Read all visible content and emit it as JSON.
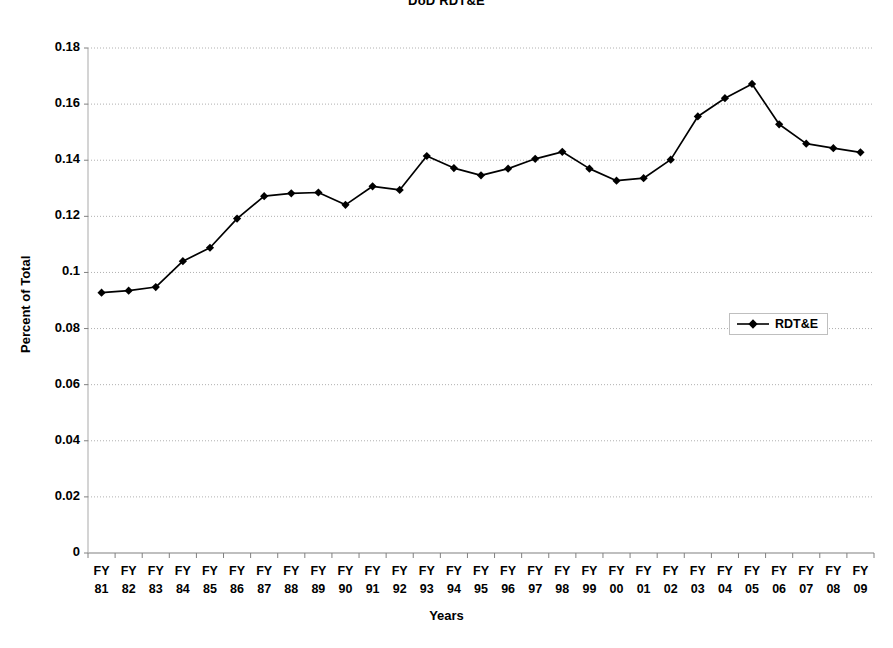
{
  "chart_data": {
    "type": "line",
    "title": "DoD RDT&E",
    "xlabel": "Years",
    "ylabel": "Percent of Total",
    "grid": true,
    "legend_position": "middle-right",
    "ylim": [
      0,
      0.18
    ],
    "ytick_labels": [
      "0.18",
      "0.16",
      "0.14",
      "0.12",
      "0.1",
      "0.08",
      "0.06",
      "0.04",
      "0.02",
      "0"
    ],
    "ytick_values": [
      0.18,
      0.16,
      0.14,
      0.12,
      0.1,
      0.08,
      0.06,
      0.04,
      0.02,
      0
    ],
    "categories": [
      "FY 81",
      "FY 82",
      "FY 83",
      "FY 84",
      "FY 85",
      "FY 86",
      "FY 87",
      "FY 88",
      "FY 89",
      "FY 90",
      "FY 91",
      "FY 92",
      "FY 93",
      "FY 94",
      "FY 95",
      "FY 96",
      "FY 97",
      "FY 98",
      "FY 99",
      "FY 00",
      "FY 01",
      "FY 02",
      "FY 03",
      "FY 04",
      "FY 05",
      "FY 06",
      "FY 07",
      "FY 08",
      "FY 09"
    ],
    "category_lines": [
      [
        "FY",
        "81"
      ],
      [
        "FY",
        "82"
      ],
      [
        "FY",
        "83"
      ],
      [
        "FY",
        "84"
      ],
      [
        "FY",
        "85"
      ],
      [
        "FY",
        "86"
      ],
      [
        "FY",
        "87"
      ],
      [
        "FY",
        "88"
      ],
      [
        "FY",
        "89"
      ],
      [
        "FY",
        "90"
      ],
      [
        "FY",
        "91"
      ],
      [
        "FY",
        "92"
      ],
      [
        "FY",
        "93"
      ],
      [
        "FY",
        "94"
      ],
      [
        "FY",
        "95"
      ],
      [
        "FY",
        "96"
      ],
      [
        "FY",
        "97"
      ],
      [
        "FY",
        "98"
      ],
      [
        "FY",
        "99"
      ],
      [
        "FY",
        "00"
      ],
      [
        "FY",
        "01"
      ],
      [
        "FY",
        "02"
      ],
      [
        "FY",
        "03"
      ],
      [
        "FY",
        "04"
      ],
      [
        "FY",
        "05"
      ],
      [
        "FY",
        "06"
      ],
      [
        "FY",
        "07"
      ],
      [
        "FY",
        "08"
      ],
      [
        "FY",
        "09"
      ]
    ],
    "series": [
      {
        "name": "RDT&E",
        "marker": "diamond",
        "color": "#000000",
        "values": [
          0.0928,
          0.0935,
          0.0948,
          0.104,
          0.1088,
          0.1192,
          0.1272,
          0.1282,
          0.1285,
          0.1241,
          0.1307,
          0.1294,
          0.1415,
          0.1372,
          0.1346,
          0.137,
          0.1405,
          0.143,
          0.137,
          0.1327,
          0.1336,
          0.1402,
          0.1556,
          0.1621,
          0.1672,
          0.1528,
          0.1459,
          0.1443,
          0.1428
        ]
      }
    ]
  },
  "legend": {
    "entries": [
      {
        "label": "RDT&E"
      }
    ]
  }
}
